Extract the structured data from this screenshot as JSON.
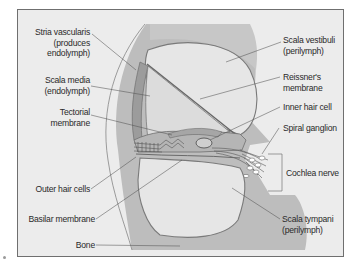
{
  "figure": {
    "colors": {
      "background": "#ececec",
      "frame_border": "#6f6f6f",
      "tissue_dark": "#a9a9a9",
      "tissue_mid": "#bdbdbd",
      "fluid_light": "#e4e4e4",
      "leader_line": "#555555",
      "text": "#2a2a2a"
    },
    "labels_left": [
      {
        "id": "stria-vascularis",
        "lines": [
          "Stria vascularis",
          "(produces",
          "endolymph)"
        ]
      },
      {
        "id": "scala-media",
        "lines": [
          "Scala media",
          "(endolymph)"
        ]
      },
      {
        "id": "tectorial-membrane",
        "lines": [
          "Tectorial",
          "membrane"
        ]
      },
      {
        "id": "outer-hair-cells",
        "lines": [
          "Outer hair cells"
        ]
      },
      {
        "id": "basilar-membrane",
        "lines": [
          "Basilar membrane"
        ]
      },
      {
        "id": "bone",
        "lines": [
          "Bone"
        ]
      }
    ],
    "labels_right": [
      {
        "id": "scala-vestibuli",
        "lines": [
          "Scala vestibuli",
          "(perilymph)"
        ]
      },
      {
        "id": "reissners-membrane",
        "lines": [
          "Reissner's",
          "membrane"
        ]
      },
      {
        "id": "inner-hair-cell",
        "lines": [
          "Inner hair cell"
        ]
      },
      {
        "id": "spiral-ganglion",
        "lines": [
          "Spiral ganglion"
        ]
      },
      {
        "id": "cochlea-nerve",
        "lines": [
          "Cochlea nerve"
        ]
      },
      {
        "id": "scala-tympani",
        "lines": [
          "Scala tympani",
          "(perilymph)"
        ]
      }
    ]
  }
}
